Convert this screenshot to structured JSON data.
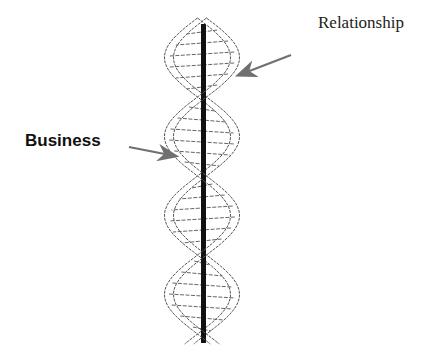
{
  "diagram": {
    "labels": {
      "relationship": "Relationship",
      "business": "Business"
    },
    "strands": [
      {
        "name": "relationship-strand",
        "represents": "Relationship"
      },
      {
        "name": "business-strand",
        "represents": "Business"
      }
    ],
    "colors": {
      "arrow": "#707070",
      "rod": "#111111",
      "strand_outline": "#555555",
      "background": "#ffffff"
    }
  }
}
